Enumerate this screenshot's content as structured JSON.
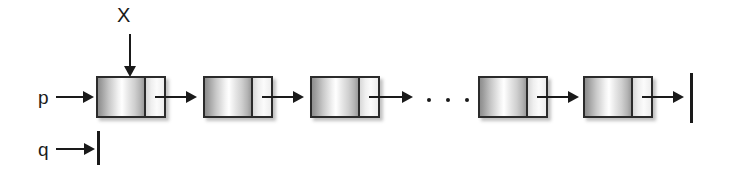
{
  "diagram": {
    "kind": "linked-list-diagram",
    "background_color": "#ffffff",
    "ink_color": "#1a1a1a",
    "node_border_color": "#2b2b2b",
    "labels": {
      "x": "X",
      "p": "p",
      "q": "q"
    },
    "ellipsis": "• • •",
    "nodes": [
      {
        "id": "node-1",
        "data_text": "",
        "pointer_text": ""
      },
      {
        "id": "node-2",
        "data_text": "",
        "pointer_text": ""
      },
      {
        "id": "node-3",
        "data_text": "",
        "pointer_text": ""
      },
      {
        "id": "node-4",
        "data_text": "",
        "pointer_text": ""
      },
      {
        "id": "node-5",
        "data_text": "",
        "pointer_text": ""
      }
    ],
    "terminators": [
      {
        "id": "q-null",
        "meaning": "null"
      },
      {
        "id": "tail-null",
        "meaning": "null"
      }
    ]
  }
}
